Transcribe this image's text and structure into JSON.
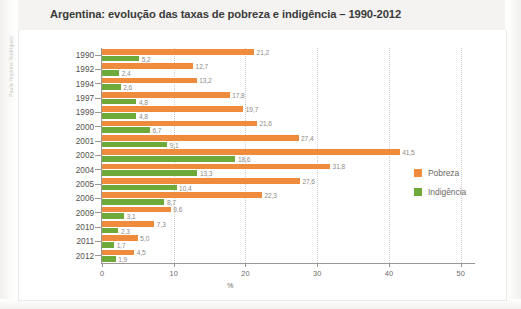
{
  "figure": {
    "title": "Argentina: evolução das taxas de pobreza e indigência – 1990-2012",
    "credit": "Paula Hopkins Rodrigues"
  },
  "legend": {
    "position": "right",
    "items": [
      {
        "label": "Pobreza",
        "color": "#ef8b3c",
        "swatch_name": "legend-swatch-pobreza"
      },
      {
        "label": "Indigência",
        "color": "#6daa3a",
        "swatch_name": "legend-swatch-indigencia"
      }
    ]
  },
  "chart_data": {
    "type": "bar",
    "orientation": "horizontal",
    "title": "Argentina: evolução das taxas de pobreza e indigência – 1990-2012",
    "xlabel": "%",
    "ylabel": "",
    "xlim": [
      0,
      52
    ],
    "xticks": [
      0,
      10,
      20,
      30,
      40,
      50
    ],
    "xtick_labels": [
      "0",
      "10",
      "20",
      "30",
      "40",
      "50"
    ],
    "grid": "vertical-dotted",
    "categories": [
      "1990",
      "1992",
      "1994",
      "1997",
      "1999",
      "2000",
      "2001",
      "2002",
      "2004",
      "2005",
      "2006",
      "2009",
      "2010",
      "2011",
      "2012"
    ],
    "series": [
      {
        "name": "Pobreza",
        "color": "#ef8b3c",
        "values": [
          21.2,
          12.7,
          13.2,
          17.8,
          19.7,
          21.6,
          27.4,
          41.5,
          31.8,
          27.6,
          22.3,
          9.6,
          7.3,
          5.0,
          4.5
        ],
        "value_labels": [
          "21,2",
          "12,7",
          "13,2",
          "17,8",
          "19,7",
          "21,6",
          "27,4",
          "41,5",
          "31,8",
          "27,6",
          "22,3",
          "9,6",
          "7,3",
          "5,0",
          "4,5"
        ]
      },
      {
        "name": "Indigência",
        "color": "#6daa3a",
        "values": [
          5.2,
          2.4,
          2.6,
          4.8,
          4.8,
          6.7,
          9.1,
          18.6,
          13.3,
          10.4,
          8.7,
          3.1,
          2.3,
          1.7,
          1.9
        ],
        "value_labels": [
          "5,2",
          "2,4",
          "2,6",
          "4,8",
          "4,8",
          "6,7",
          "9,1",
          "18,6",
          "13,3",
          "10,4",
          "8,7",
          "3,1",
          "2,3",
          "1,7",
          "1,9"
        ]
      }
    ]
  }
}
